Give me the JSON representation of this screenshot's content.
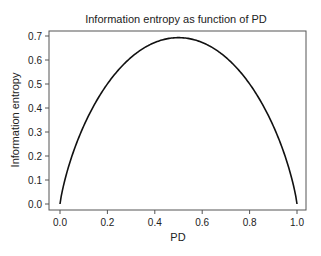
{
  "chart_data": {
    "type": "line",
    "title": "Information entropy as function of PD",
    "xlabel": "PD",
    "ylabel": "Information entropy",
    "xlim": [
      0.0,
      1.0
    ],
    "ylim": [
      0.0,
      0.7
    ],
    "xticks": [
      0.0,
      0.2,
      0.4,
      0.6,
      0.8,
      1.0
    ],
    "xtick_labels": [
      "0.0",
      "0.2",
      "0.4",
      "0.6",
      "0.8",
      "1.0"
    ],
    "yticks": [
      0.0,
      0.1,
      0.2,
      0.3,
      0.4,
      0.5,
      0.6,
      0.7
    ],
    "ytick_labels": [
      "0.0",
      "0.1",
      "0.2",
      "0.3",
      "0.4",
      "0.5",
      "0.6",
      "0.7"
    ],
    "grid": false,
    "legend": "none",
    "series": [
      {
        "name": "Information entropy",
        "color": "#111111",
        "x": [
          0.0,
          0.01,
          0.02,
          0.05,
          0.1,
          0.15,
          0.2,
          0.25,
          0.3,
          0.35,
          0.4,
          0.45,
          0.5,
          0.55,
          0.6,
          0.65,
          0.7,
          0.75,
          0.8,
          0.85,
          0.9,
          0.95,
          0.98,
          0.99,
          1.0
        ],
        "y": [
          0.0,
          0.056,
          0.098,
          0.199,
          0.325,
          0.423,
          0.5,
          0.562,
          0.611,
          0.647,
          0.673,
          0.688,
          0.693,
          0.688,
          0.673,
          0.647,
          0.611,
          0.562,
          0.5,
          0.423,
          0.325,
          0.199,
          0.098,
          0.056,
          0.0
        ]
      }
    ]
  }
}
